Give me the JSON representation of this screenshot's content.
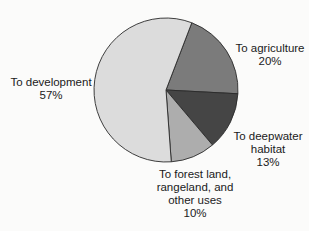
{
  "chart_data": {
    "type": "pie",
    "title": "",
    "categories": [
      "To development",
      "To agriculture",
      "To deepwater habitat",
      "To forest land, rangeland, and other uses"
    ],
    "values": [
      57,
      20,
      13,
      10
    ],
    "unit": "%",
    "start_angle_deg": 21,
    "direction": "clockwise",
    "order_clockwise_from_start": [
      "To agriculture",
      "To deepwater habitat",
      "To forest land, rangeland, and other uses",
      "To development"
    ],
    "colors": {
      "To development": "#dcdcdc",
      "To agriculture": "#7b7b7b",
      "To deepwater habitat": "#454545",
      "To forest land, rangeland, and other uses": "#adadad"
    },
    "legend": "none (direct labels)"
  },
  "labels": {
    "development": {
      "line1": "To development",
      "value": "57%"
    },
    "agriculture": {
      "line1": "To agriculture",
      "value": "20%"
    },
    "deepwater": {
      "line1": "To deepwater",
      "line2": "habitat",
      "value": "13%"
    },
    "forest": {
      "line1": "To forest land,",
      "line2": "rangeland, and",
      "line3": "other uses",
      "value": "10%"
    }
  }
}
